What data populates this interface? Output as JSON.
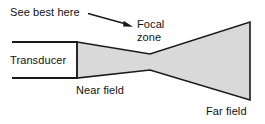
{
  "figure": {
    "type": "diagram",
    "background_color": "#ffffff",
    "line_color": "#1a1a1a",
    "beam_fill_color": "#d9d9d9"
  },
  "labels": {
    "see_best_here": "See best here",
    "focal_line1": "Focal",
    "focal_line2": "zone",
    "transducer": "Transducer",
    "near_field": "Near field",
    "far_field": "Far field"
  },
  "geometry": {
    "transducer": {
      "top_line": {
        "x1": 12,
        "y1": 42,
        "x2": 77,
        "y2": 42
      },
      "bottom_line": {
        "x1": 12,
        "y1": 78,
        "x2": 77,
        "y2": 78
      },
      "face_line": {
        "x1": 77,
        "y1": 42,
        "x2": 77,
        "y2": 78
      }
    },
    "beam_outline_points": "77,42 150,54 250,22 250,100 150,70 77,78",
    "focal_waist": {
      "x": 150,
      "y_top": 54,
      "y_bottom": 70
    },
    "far_edge": {
      "x": 250,
      "y_top": 22,
      "y_bottom": 100
    }
  },
  "annotation_arrow": {
    "from": {
      "x": 88,
      "y": 14
    },
    "to": {
      "x": 132,
      "y": 26
    },
    "head": "triangle"
  }
}
